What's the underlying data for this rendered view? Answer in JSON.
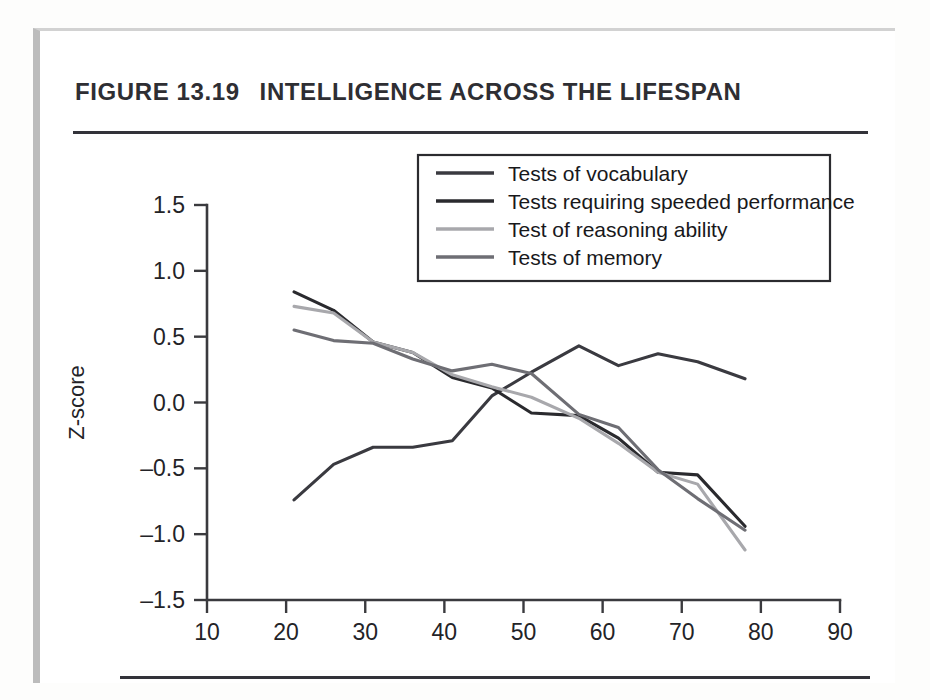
{
  "figure": {
    "number": "FIGURE 13.19",
    "title": "INTELLIGENCE ACROSS THE LIFESPAN"
  },
  "colors": {
    "vocabulary": "#3a3a40",
    "speeded": "#2a2a2e",
    "reasoning": "#a8a8ac",
    "memory": "#6e6e74",
    "axis": "#3a3a3e",
    "text": "#232327",
    "frame": "#bcbcbc",
    "rule": "#33333a"
  },
  "chart_data": {
    "type": "line",
    "title": "Intelligence Across the Lifespan",
    "xlabel": "Chronological age (in years)",
    "ylabel": "Z-score",
    "xlim": [
      10,
      90
    ],
    "ylim": [
      -1.5,
      1.5
    ],
    "xticks": [
      10,
      20,
      30,
      40,
      50,
      60,
      70,
      80,
      90
    ],
    "yticks": [
      1.5,
      1.0,
      0.5,
      0.0,
      -0.5,
      -1.0,
      -1.5
    ],
    "ytick_labels": [
      "1.5",
      "1.0",
      "0.5",
      "0.0",
      "–0.5",
      "–1.0",
      "–1.5"
    ],
    "grid": false,
    "legend_position": "upper right",
    "x": [
      21,
      26,
      31,
      36,
      41,
      46,
      51,
      57,
      62,
      67,
      72,
      78
    ],
    "series": [
      {
        "name": "Tests of vocabulary",
        "color": "#3a3a40",
        "values": [
          -0.74,
          -0.47,
          -0.34,
          -0.34,
          -0.29,
          0.05,
          0.23,
          0.43,
          0.28,
          0.37,
          0.31,
          0.18
        ]
      },
      {
        "name": "Tests requiring speeded performance",
        "color": "#2a2a2e",
        "values": [
          0.84,
          0.7,
          0.46,
          0.38,
          0.19,
          0.11,
          -0.08,
          -0.1,
          -0.27,
          -0.53,
          -0.55,
          -0.94
        ]
      },
      {
        "name": "Test of reasoning ability",
        "color": "#a8a8ac",
        "values": [
          0.73,
          0.68,
          0.46,
          0.38,
          0.21,
          0.12,
          0.04,
          -0.12,
          -0.31,
          -0.53,
          -0.62,
          -1.12
        ]
      },
      {
        "name": "Tests of memory",
        "color": "#6e6e74",
        "values": [
          0.55,
          0.47,
          0.45,
          0.33,
          0.24,
          0.29,
          0.22,
          -0.09,
          -0.19,
          -0.51,
          -0.73,
          -0.97
        ]
      }
    ]
  },
  "legend": {
    "items": [
      {
        "label": "Tests of vocabulary",
        "color": "#3a3a40"
      },
      {
        "label": "Tests requiring speeded performance",
        "color": "#2a2a2e"
      },
      {
        "label": "Test of reasoning ability",
        "color": "#a8a8ac"
      },
      {
        "label": "Tests of memory",
        "color": "#6e6e74"
      }
    ]
  }
}
